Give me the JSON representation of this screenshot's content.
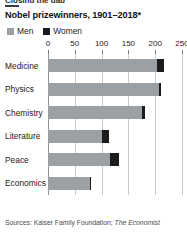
{
  "clipped_headline": "Closing the gap",
  "chart_title": "Nobel prizewinners, 1901–2018*",
  "legend": [
    {
      "label": "Men",
      "color": "#9aa0a4",
      "icon": "square-swatch-men"
    },
    {
      "label": "Women",
      "color": "#1c1c1c",
      "icon": "square-swatch-women"
    }
  ],
  "source": "Sources: Kaiser Family Foundation; ",
  "source_italic": "The Economist",
  "chart_data": {
    "type": "bar",
    "orientation": "horizontal",
    "stacked": true,
    "title": "Nobel prizewinners, 1901–2018*",
    "xlabel": "",
    "ylabel": "",
    "xlim": [
      0,
      250
    ],
    "xticks": [
      0,
      50,
      100,
      150,
      200,
      250
    ],
    "grid": true,
    "legend_position": "top-left",
    "categories": [
      "Medicine",
      "Physics",
      "Chemistry",
      "Literature",
      "Peace",
      "Economics"
    ],
    "series": [
      {
        "name": "Men",
        "color": "#9aa0a4",
        "values": [
          204,
          207,
          176,
          100,
          116,
          79
        ]
      },
      {
        "name": "Women",
        "color": "#1c1c1c",
        "values": [
          12,
          3,
          5,
          14,
          17,
          2
        ]
      }
    ],
    "totals": [
      216,
      210,
      181,
      114,
      133,
      81
    ]
  }
}
